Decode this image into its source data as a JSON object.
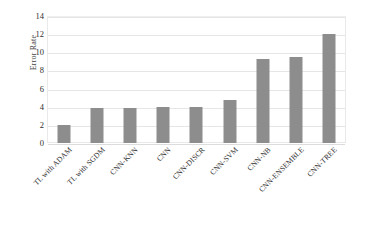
{
  "chart_data": {
    "type": "bar",
    "title": "",
    "xlabel": "",
    "ylabel": "Error Rate",
    "categories": [
      "TL with ADAM",
      "TL with SGDM",
      "CNN-KNN",
      "CNN",
      "CNN-DISCR",
      "CNN-SVM",
      "CNN-NB",
      "CNN-ENSEMBLE",
      "CNN-TREE"
    ],
    "values": [
      2.0,
      3.9,
      3.9,
      4.0,
      4.0,
      4.7,
      9.3,
      9.5,
      12.0
    ],
    "ylim": [
      0,
      14
    ],
    "ytick_values": [
      0,
      2,
      4,
      6,
      8,
      10,
      12,
      14
    ],
    "ytick_labels": [
      "0",
      "2",
      "4",
      "6",
      "8",
      "10",
      "12",
      "14"
    ],
    "grid": "horizontal",
    "legend": "none",
    "bar_color": "#8d8d8d",
    "gridline_color": "#e6e6e6",
    "plot_border_color": "#e9e9e9",
    "background_color": "#ffffff"
  }
}
